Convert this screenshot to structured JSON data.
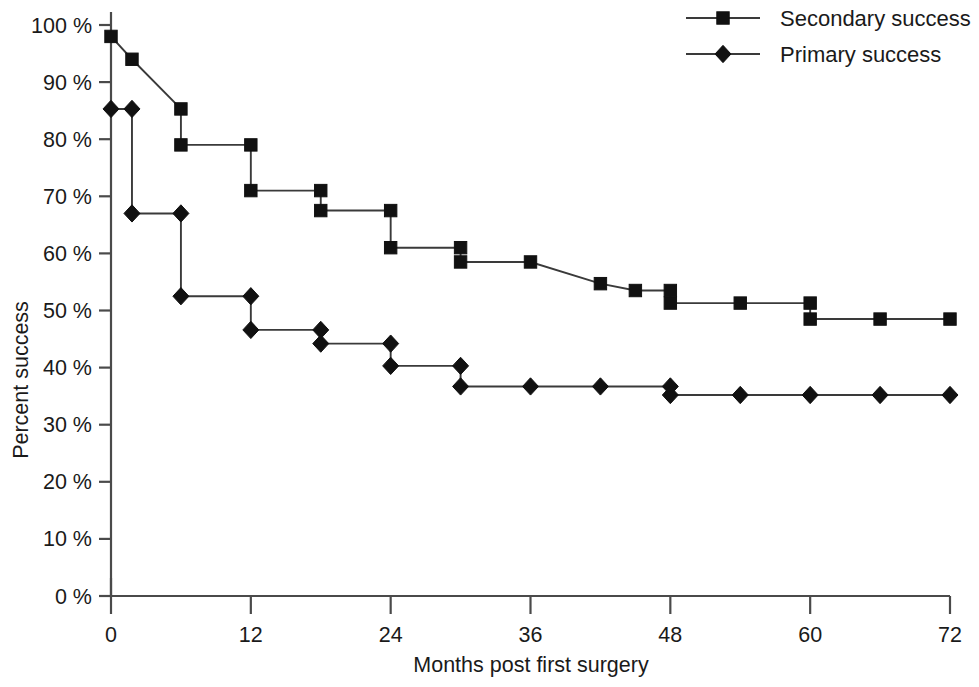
{
  "chart_data": {
    "type": "line",
    "subtype": "kaplan-meier-step",
    "title": "",
    "xlabel": "Months post first surgery",
    "ylabel": "Percent success",
    "xlim": [
      0,
      72
    ],
    "ylim": [
      0,
      100
    ],
    "xticks": [
      "0",
      "12",
      "24",
      "36",
      "48",
      "60",
      "72"
    ],
    "xtick_values": [
      0,
      12,
      24,
      36,
      48,
      60,
      72
    ],
    "yticks": [
      "0 %",
      "10 %",
      "20 %",
      "30 %",
      "40 %",
      "50 %",
      "60 %",
      "70 %",
      "80 %",
      "90 %",
      "100 %"
    ],
    "ytick_values": [
      0,
      10,
      20,
      30,
      40,
      50,
      60,
      70,
      80,
      90,
      100
    ],
    "grid": false,
    "legend_position": "top-right",
    "series": [
      {
        "name": "Secondary success",
        "marker": "square",
        "color": "#111111",
        "x": [
          0,
          1.8,
          1.8,
          6,
          6,
          12,
          12,
          18,
          18,
          24,
          24,
          30,
          30,
          36,
          42,
          45,
          48,
          48,
          54,
          60,
          60,
          66,
          72
        ],
        "y": [
          98,
          94,
          94,
          85.3,
          79,
          79,
          71,
          71,
          67.5,
          67.5,
          61,
          61,
          58.5,
          58.5,
          54.7,
          53.5,
          53.5,
          51.3,
          51.3,
          51.3,
          48.5,
          48.5,
          48.5
        ],
        "points": [
          {
            "x": 0,
            "y": 98
          },
          {
            "x": 1.8,
            "y": 94
          },
          {
            "x": 6,
            "y": 85.3
          },
          {
            "x": 6,
            "y": 79
          },
          {
            "x": 12,
            "y": 79
          },
          {
            "x": 12,
            "y": 71
          },
          {
            "x": 18,
            "y": 71
          },
          {
            "x": 18,
            "y": 67.5
          },
          {
            "x": 24,
            "y": 67.5
          },
          {
            "x": 24,
            "y": 61
          },
          {
            "x": 30,
            "y": 61
          },
          {
            "x": 30,
            "y": 58.5
          },
          {
            "x": 36,
            "y": 58.5
          },
          {
            "x": 42,
            "y": 54.7
          },
          {
            "x": 45,
            "y": 53.5
          },
          {
            "x": 48,
            "y": 53.5
          },
          {
            "x": 48,
            "y": 51.3
          },
          {
            "x": 54,
            "y": 51.3
          },
          {
            "x": 60,
            "y": 51.3
          },
          {
            "x": 60,
            "y": 48.5
          },
          {
            "x": 66,
            "y": 48.5
          },
          {
            "x": 72,
            "y": 48.5
          }
        ]
      },
      {
        "name": "Primary success",
        "marker": "diamond",
        "color": "#111111",
        "x": [
          0,
          1.8,
          1.8,
          6,
          6,
          12,
          12,
          18,
          18,
          24,
          24,
          30,
          30,
          36,
          42,
          48,
          48,
          54,
          60,
          66,
          72
        ],
        "y": [
          85.3,
          85.3,
          67,
          67,
          52.5,
          52.5,
          46.6,
          46.6,
          44.2,
          44.2,
          40.3,
          40.3,
          36.7,
          36.7,
          36.7,
          36.7,
          35.2,
          35.2,
          35.2,
          35.2,
          35.2
        ],
        "points": [
          {
            "x": 0,
            "y": 85.3
          },
          {
            "x": 1.8,
            "y": 85.3
          },
          {
            "x": 1.8,
            "y": 67
          },
          {
            "x": 6,
            "y": 67
          },
          {
            "x": 6,
            "y": 52.5
          },
          {
            "x": 12,
            "y": 52.5
          },
          {
            "x": 12,
            "y": 46.6
          },
          {
            "x": 18,
            "y": 46.6
          },
          {
            "x": 18,
            "y": 44.2
          },
          {
            "x": 24,
            "y": 44.2
          },
          {
            "x": 24,
            "y": 40.3
          },
          {
            "x": 30,
            "y": 40.3
          },
          {
            "x": 30,
            "y": 36.7
          },
          {
            "x": 36,
            "y": 36.7
          },
          {
            "x": 42,
            "y": 36.7
          },
          {
            "x": 48,
            "y": 36.7
          },
          {
            "x": 48,
            "y": 35.2
          },
          {
            "x": 54,
            "y": 35.2
          },
          {
            "x": 60,
            "y": 35.2
          },
          {
            "x": 66,
            "y": 35.2
          },
          {
            "x": 72,
            "y": 35.2
          }
        ]
      }
    ]
  },
  "legend": {
    "entries": [
      {
        "label": "Secondary success",
        "marker": "square"
      },
      {
        "label": "Primary success",
        "marker": "diamond"
      }
    ]
  }
}
